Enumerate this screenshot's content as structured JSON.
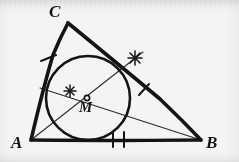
{
  "figure": {
    "kind": "geometry-diagram",
    "background_color": "#f4f4f3",
    "ink_color": "#141414",
    "thin_ink_color": "#2b2b2b",
    "width": 239,
    "height": 162
  },
  "labels": {
    "vertex_c": "C",
    "vertex_a": "A",
    "vertex_b": "B",
    "center_m": "M"
  },
  "points": {
    "A": {
      "x": 31,
      "y": 140
    },
    "B": {
      "x": 201,
      "y": 140
    },
    "C": {
      "x": 68,
      "y": 23
    },
    "M": {
      "x": 87,
      "y": 98
    }
  },
  "incircle": {
    "cx": 88,
    "cy": 98,
    "r": 42
  },
  "sides": [
    {
      "name": "side-ab",
      "from": "A",
      "to": "B",
      "tick_count": 2
    },
    {
      "name": "side-ac",
      "from": "A",
      "to": "C",
      "tick_count": 1
    },
    {
      "name": "side-cb",
      "from": "C",
      "to": "B",
      "tick_count": 1
    }
  ],
  "cevians": [
    {
      "name": "bisector-from-a",
      "from": "A",
      "through": "M",
      "to_point": {
        "x": 143,
        "y": 52
      },
      "mark": "asterisk"
    },
    {
      "name": "bisector-from-b",
      "from": "B",
      "through": "M",
      "to_point": {
        "x": 40,
        "y": 88
      },
      "mark": "asterisk"
    }
  ],
  "marks": {
    "asterisk_upper_right": {
      "x": 135,
      "y": 58
    },
    "asterisk_near_center": {
      "x": 70,
      "y": 91
    },
    "tick_ab_1": {
      "x": 113,
      "y": 139
    },
    "tick_ab_2": {
      "x": 124,
      "y": 139
    },
    "tick_ac": {
      "x": 48,
      "y": 58
    },
    "tick_cb": {
      "x": 144,
      "y": 90
    }
  }
}
